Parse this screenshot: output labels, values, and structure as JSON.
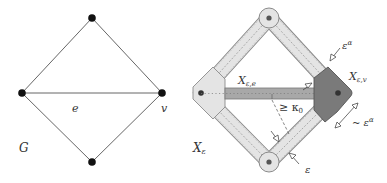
{
  "left_figure": {
    "graph_label": "G",
    "edge_label": "e",
    "vertex_label": "v",
    "nodes": [
      {
        "id": "top",
        "x": 92,
        "y": 18
      },
      {
        "id": "left",
        "x": 22,
        "y": 93
      },
      {
        "id": "right",
        "x": 162,
        "y": 93
      },
      {
        "id": "bottom",
        "x": 92,
        "y": 162
      }
    ],
    "edges": [
      [
        "top",
        "left"
      ],
      [
        "top",
        "right"
      ],
      [
        "left",
        "right"
      ],
      [
        "left",
        "bottom"
      ],
      [
        "right",
        "bottom"
      ]
    ]
  },
  "right_figure": {
    "space_label": "X",
    "space_sub": "ε",
    "edge_piece_label": "X",
    "edge_piece_sub": "ε,e",
    "vertex_piece_label": "X",
    "vertex_piece_sub": "ε,v",
    "angle_label": "≥ κ",
    "angle_sub": "0",
    "width_label_top": "ε",
    "width_label_top_sup": "α",
    "width_label_right": "~ ε",
    "width_label_right_sup": "α",
    "width_label_bottom": "ε"
  },
  "colors": {
    "tube_fill": "#e4e4e4",
    "tube_stroke": "#888888",
    "vertex_piece_fill": "#7a7a7a",
    "edge_piece_fill": "#a8a8a8",
    "node": "#111111",
    "line": "#555555"
  }
}
